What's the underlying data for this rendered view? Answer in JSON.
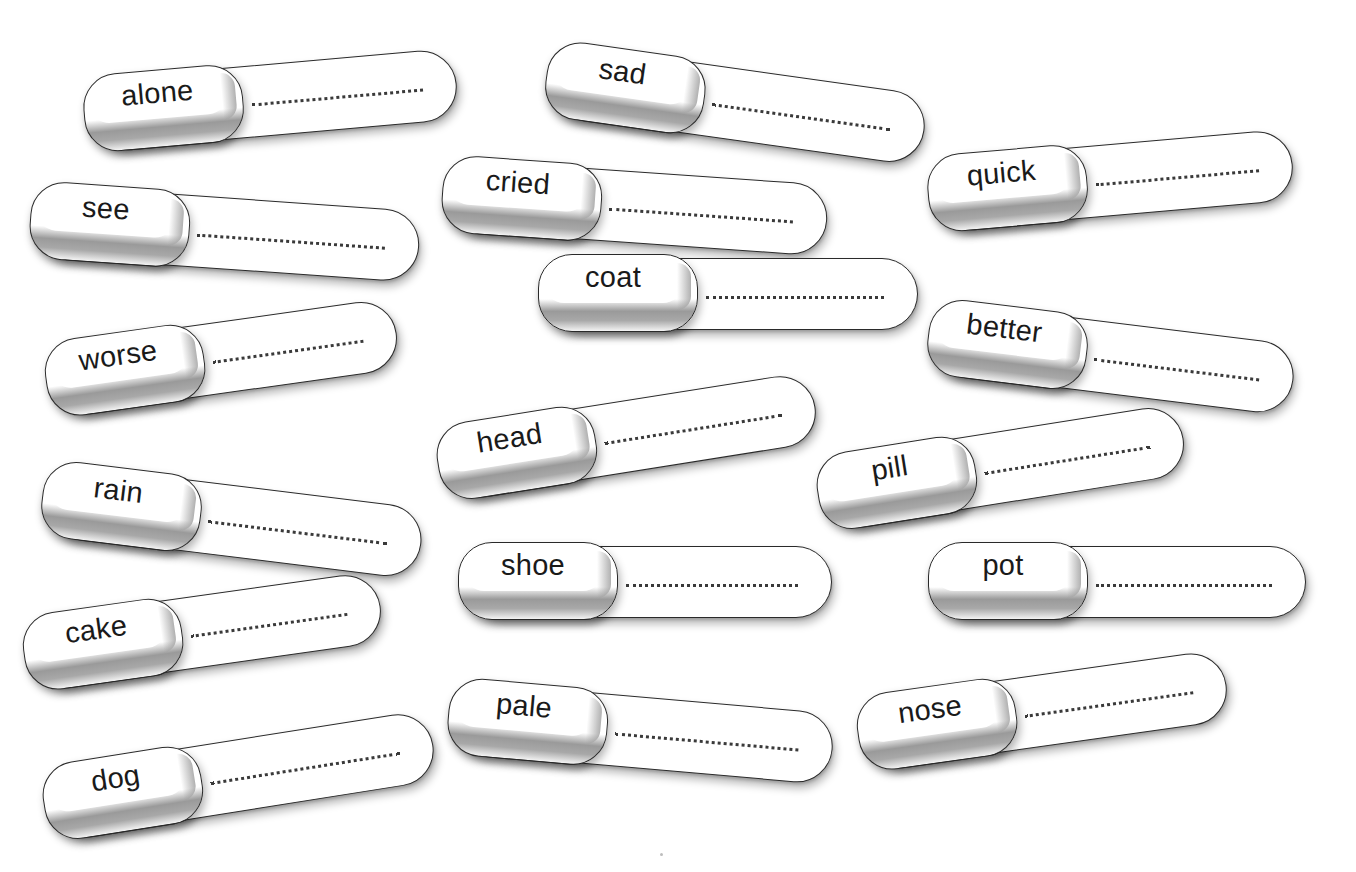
{
  "worksheet": {
    "activity": "word-matching-tags",
    "line_style": "dotted",
    "colors": {
      "background": "#ffffff",
      "outline": "#2a2a2a",
      "chip_shadow": "#9a9a9a",
      "dots": "#3a3a3a",
      "text": "#1a1a1a"
    },
    "tags": [
      {
        "word": "alone",
        "x": 86,
        "y": 80,
        "w": 372,
        "h": 72,
        "rot": -5
      },
      {
        "word": "sad",
        "x": 548,
        "y": 42,
        "w": 380,
        "h": 72,
        "rot": 8
      },
      {
        "word": "quick",
        "x": 930,
        "y": 160,
        "w": 364,
        "h": 72,
        "rot": -5
      },
      {
        "word": "see",
        "x": 32,
        "y": 184,
        "w": 388,
        "h": 72,
        "rot": 4
      },
      {
        "word": "cried",
        "x": 444,
        "y": 158,
        "w": 384,
        "h": 72,
        "rot": 4
      },
      {
        "word": "coat",
        "x": 540,
        "y": 258,
        "w": 378,
        "h": 72,
        "rot": 0
      },
      {
        "word": "better",
        "x": 930,
        "y": 300,
        "w": 366,
        "h": 72,
        "rot": 7
      },
      {
        "word": "worse",
        "x": 48,
        "y": 346,
        "w": 352,
        "h": 72,
        "rot": -8
      },
      {
        "word": "rain",
        "x": 44,
        "y": 462,
        "w": 380,
        "h": 72,
        "rot": 7
      },
      {
        "word": "head",
        "x": 440,
        "y": 430,
        "w": 380,
        "h": 72,
        "rot": -9
      },
      {
        "word": "pill",
        "x": 820,
        "y": 460,
        "w": 368,
        "h": 72,
        "rot": -9
      },
      {
        "word": "shoe",
        "x": 460,
        "y": 546,
        "w": 372,
        "h": 72,
        "rot": 0
      },
      {
        "word": "pot",
        "x": 930,
        "y": 546,
        "w": 376,
        "h": 72,
        "rot": 0
      },
      {
        "word": "cake",
        "x": 26,
        "y": 620,
        "w": 358,
        "h": 72,
        "rot": -8
      },
      {
        "word": "pale",
        "x": 450,
        "y": 680,
        "w": 384,
        "h": 72,
        "rot": 5
      },
      {
        "word": "nose",
        "x": 860,
        "y": 700,
        "w": 370,
        "h": 72,
        "rot": -8
      },
      {
        "word": "dog",
        "x": 46,
        "y": 770,
        "w": 392,
        "h": 72,
        "rot": -9
      }
    ]
  }
}
